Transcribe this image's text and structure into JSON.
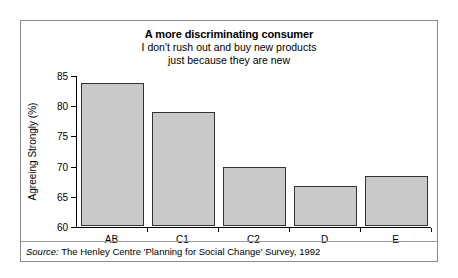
{
  "figure": {
    "title": "A more discriminating consumer",
    "subtitle_lines": [
      "I don't rush out and buy new products",
      "just because they are new"
    ],
    "source_prefix": "Source:",
    "source_text": " The Henley Centre 'Planning for Social Change' Survey, 1992",
    "border_color": "#8a8a8a",
    "bar_fill_color": "#c9c9c9",
    "bar_edge_color": "#333333"
  },
  "chart_data": {
    "type": "bar",
    "title": "A more discriminating consumer",
    "subtitle": "I don't rush out and buy new products just because they are new",
    "xlabel": "",
    "ylabel": "Agreeing Strongly (%)",
    "categories": [
      "AB",
      "C1",
      "C2",
      "D",
      "E"
    ],
    "values": [
      83.7,
      78.8,
      69.7,
      66.6,
      68.3
    ],
    "ylim": [
      60,
      85
    ],
    "yticks": [
      60,
      65,
      70,
      75,
      80,
      85
    ],
    "ytick_labels": [
      "60",
      "65",
      "70",
      "75",
      "80",
      "85"
    ],
    "grid": false,
    "legend": null,
    "source": "Source: The Henley Centre 'Planning for Social Change' Survey, 1992"
  }
}
